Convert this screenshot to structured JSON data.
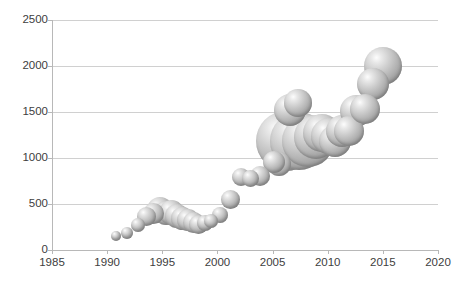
{
  "chart_data": {
    "type": "scatter",
    "title": "",
    "xlabel": "",
    "ylabel": "",
    "xlim": [
      1985,
      2020
    ],
    "ylim": [
      0,
      2500
    ],
    "grid": true,
    "legend": null,
    "x_ticks": [
      1985,
      1990,
      1995,
      2000,
      2005,
      2010,
      2015,
      2020
    ],
    "y_ticks": [
      0,
      500,
      1000,
      1500,
      2000,
      2500
    ],
    "marker_style": "3d-sphere-gray",
    "note": "Bubble / scatter plot: marker size grows with series value over time",
    "points": [
      {
        "x": 1990.8,
        "y": 150,
        "size": 5.0
      },
      {
        "x": 1991.8,
        "y": 190,
        "size": 6.0
      },
      {
        "x": 1992.8,
        "y": 270,
        "size": 7.0
      },
      {
        "x": 1993.6,
        "y": 360,
        "size": 9.5
      },
      {
        "x": 1994.2,
        "y": 395,
        "size": 10.5
      },
      {
        "x": 1994.8,
        "y": 430,
        "size": 13.0
      },
      {
        "x": 1995.3,
        "y": 400,
        "size": 12.0
      },
      {
        "x": 1995.8,
        "y": 405,
        "size": 12.5
      },
      {
        "x": 1996.3,
        "y": 370,
        "size": 12.0
      },
      {
        "x": 1996.8,
        "y": 345,
        "size": 11.5
      },
      {
        "x": 1997.3,
        "y": 330,
        "size": 11.0
      },
      {
        "x": 1997.8,
        "y": 300,
        "size": 10.5
      },
      {
        "x": 1998.3,
        "y": 275,
        "size": 9.5
      },
      {
        "x": 1998.9,
        "y": 295,
        "size": 8.0
      },
      {
        "x": 1999.4,
        "y": 320,
        "size": 7.0
      },
      {
        "x": 2000.2,
        "y": 380,
        "size": 8.0
      },
      {
        "x": 2001.2,
        "y": 545,
        "size": 9.5
      },
      {
        "x": 2002.1,
        "y": 795,
        "size": 9.0
      },
      {
        "x": 2003.0,
        "y": 780,
        "size": 8.5
      },
      {
        "x": 2003.9,
        "y": 800,
        "size": 10.0
      },
      {
        "x": 2005.1,
        "y": 960,
        "size": 11.0
      },
      {
        "x": 2005.6,
        "y": 940,
        "size": 12.0
      },
      {
        "x": 2006.2,
        "y": 1180,
        "size": 30.0
      },
      {
        "x": 2006.6,
        "y": 1520,
        "size": 16.0
      },
      {
        "x": 2007.3,
        "y": 1600,
        "size": 14.0
      },
      {
        "x": 2007.4,
        "y": 1180,
        "size": 29.0
      },
      {
        "x": 2008.2,
        "y": 1190,
        "size": 26.0
      },
      {
        "x": 2008.9,
        "y": 1230,
        "size": 22.0
      },
      {
        "x": 2009.5,
        "y": 1270,
        "size": 19.0
      },
      {
        "x": 2010.1,
        "y": 1240,
        "size": 18.0
      },
      {
        "x": 2010.7,
        "y": 1180,
        "size": 16.0
      },
      {
        "x": 2011.3,
        "y": 1290,
        "size": 16.0
      },
      {
        "x": 2011.9,
        "y": 1290,
        "size": 15.0
      },
      {
        "x": 2012.6,
        "y": 1510,
        "size": 16.0
      },
      {
        "x": 2013.4,
        "y": 1530,
        "size": 15.0
      },
      {
        "x": 2014.1,
        "y": 1800,
        "size": 16.0
      },
      {
        "x": 2015.0,
        "y": 2005,
        "size": 19.0
      }
    ]
  }
}
